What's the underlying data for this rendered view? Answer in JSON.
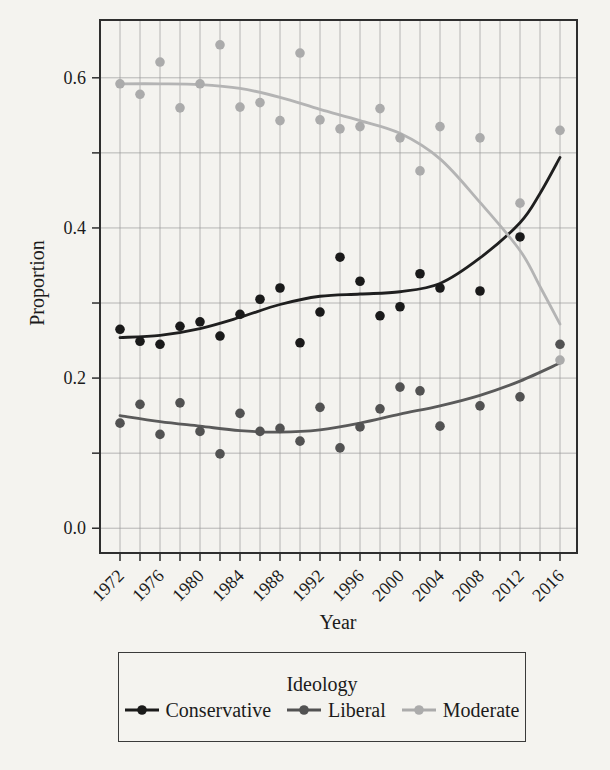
{
  "figure": {
    "background_color": "#f4f3ef",
    "text_color": "#1b1b1b",
    "grid_color": "#979797",
    "border_color": "#2e2e2e"
  },
  "chart_data": {
    "type": "scatter",
    "title": "",
    "xlabel": "Year",
    "ylabel": "Proportion",
    "xlim": [
      1970,
      2017.7
    ],
    "ylim": [
      -0.033,
      0.677
    ],
    "grid": "on",
    "x_grid_step_years": 2,
    "y_grid_step": 0.1,
    "x_tick_labels": [
      "1972",
      "1976",
      "1980",
      "1984",
      "1988",
      "1992",
      "1996",
      "2000",
      "2004",
      "2008",
      "2012",
      "2016"
    ],
    "x_tick_values": [
      1972,
      1976,
      1980,
      1984,
      1988,
      1992,
      1996,
      2000,
      2004,
      2008,
      2012,
      2016
    ],
    "x_minor_tick_step_years": 2,
    "y_tick_labels": [
      "0.0",
      "0.2",
      "0.4",
      "0.6"
    ],
    "y_tick_values": [
      0.0,
      0.2,
      0.4,
      0.6
    ],
    "y_minor_tick_step": 0.1,
    "legend_position": "bottom",
    "series": [
      {
        "name": "Conservative",
        "dot_color": "#1a1a1a",
        "line_color": "#1f1f1f",
        "points": [
          [
            1972,
            0.265
          ],
          [
            1974,
            0.249
          ],
          [
            1976,
            0.245
          ],
          [
            1978,
            0.269
          ],
          [
            1980,
            0.275
          ],
          [
            1982,
            0.256
          ],
          [
            1984,
            0.285
          ],
          [
            1986,
            0.305
          ],
          [
            1988,
            0.32
          ],
          [
            1990,
            0.247
          ],
          [
            1992,
            0.288
          ],
          [
            1994,
            0.361
          ],
          [
            1996,
            0.329
          ],
          [
            1998,
            0.283
          ],
          [
            2000,
            0.295
          ],
          [
            2002,
            0.339
          ],
          [
            2004,
            0.32
          ],
          [
            2008,
            0.316
          ],
          [
            2012,
            0.388
          ]
        ],
        "smooth_line": [
          [
            1972,
            0.254
          ],
          [
            1976,
            0.257
          ],
          [
            1980,
            0.266
          ],
          [
            1984,
            0.281
          ],
          [
            1988,
            0.298
          ],
          [
            1992,
            0.309
          ],
          [
            1996,
            0.312
          ],
          [
            2000,
            0.315
          ],
          [
            2004,
            0.326
          ],
          [
            2008,
            0.36
          ],
          [
            2012,
            0.407
          ],
          [
            2014,
            0.446
          ],
          [
            2016,
            0.494
          ]
        ]
      },
      {
        "name": "Liberal",
        "dot_color": "#525252",
        "line_color": "#5a5a5a",
        "points": [
          [
            1972,
            0.14
          ],
          [
            1974,
            0.165
          ],
          [
            1976,
            0.125
          ],
          [
            1978,
            0.167
          ],
          [
            1980,
            0.129
          ],
          [
            1982,
            0.099
          ],
          [
            1984,
            0.153
          ],
          [
            1986,
            0.129
          ],
          [
            1988,
            0.133
          ],
          [
            1990,
            0.116
          ],
          [
            1992,
            0.161
          ],
          [
            1994,
            0.107
          ],
          [
            1996,
            0.135
          ],
          [
            1998,
            0.159
          ],
          [
            2000,
            0.188
          ],
          [
            2002,
            0.183
          ],
          [
            2004,
            0.136
          ],
          [
            2008,
            0.163
          ],
          [
            2012,
            0.175
          ],
          [
            2016,
            0.245
          ]
        ],
        "smooth_line": [
          [
            1972,
            0.15
          ],
          [
            1976,
            0.142
          ],
          [
            1980,
            0.136
          ],
          [
            1984,
            0.13
          ],
          [
            1988,
            0.128
          ],
          [
            1992,
            0.131
          ],
          [
            1996,
            0.14
          ],
          [
            2000,
            0.152
          ],
          [
            2004,
            0.163
          ],
          [
            2008,
            0.177
          ],
          [
            2012,
            0.196
          ],
          [
            2016,
            0.22
          ]
        ]
      },
      {
        "name": "Moderate",
        "dot_color": "#ababab",
        "line_color": "#b4b4b4",
        "points": [
          [
            1972,
            0.592
          ],
          [
            1974,
            0.578
          ],
          [
            1976,
            0.621
          ],
          [
            1978,
            0.56
          ],
          [
            1980,
            0.592
          ],
          [
            1982,
            0.644
          ],
          [
            1984,
            0.561
          ],
          [
            1986,
            0.567
          ],
          [
            1988,
            0.543
          ],
          [
            1990,
            0.633
          ],
          [
            1992,
            0.544
          ],
          [
            1994,
            0.532
          ],
          [
            1996,
            0.535
          ],
          [
            1998,
            0.559
          ],
          [
            2000,
            0.52
          ],
          [
            2002,
            0.476
          ],
          [
            2004,
            0.535
          ],
          [
            2008,
            0.52
          ],
          [
            2012,
            0.433
          ],
          [
            2016,
            0.53
          ],
          [
            2016,
            0.224
          ]
        ],
        "smooth_line": [
          [
            1972,
            0.592
          ],
          [
            1976,
            0.592
          ],
          [
            1980,
            0.591
          ],
          [
            1984,
            0.586
          ],
          [
            1988,
            0.574
          ],
          [
            1992,
            0.558
          ],
          [
            1996,
            0.543
          ],
          [
            2000,
            0.526
          ],
          [
            2004,
            0.492
          ],
          [
            2008,
            0.434
          ],
          [
            2012,
            0.37
          ],
          [
            2014,
            0.322
          ],
          [
            2016,
            0.272
          ]
        ]
      }
    ]
  },
  "legend": {
    "title": "Ideology",
    "entries": [
      {
        "label": "Conservative",
        "color": "#1a1a1a"
      },
      {
        "label": "Liberal",
        "color": "#525252"
      },
      {
        "label": "Moderate",
        "color": "#ababab"
      }
    ]
  }
}
